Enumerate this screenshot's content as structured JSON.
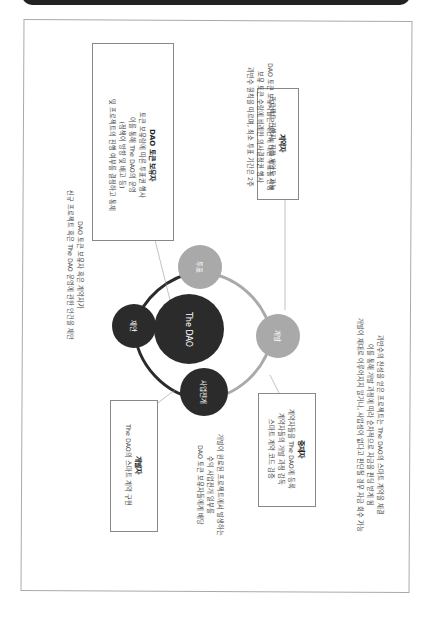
{
  "diagram": {
    "center": {
      "label": "The DAO",
      "color": "#2b2b2b"
    },
    "nodes": [
      {
        "id": "vote",
        "label": "투표",
        "color": "#a9a9a9"
      },
      {
        "id": "develop",
        "label": "개발",
        "color": "#a9a9a9"
      },
      {
        "id": "business",
        "label": "사업전개",
        "color": "#2b2b2b"
      },
      {
        "id": "propose",
        "label": "제안",
        "color": "#2b2b2b"
      }
    ],
    "boxes": {
      "token_holder": {
        "title": "DAO 토큰 보유자",
        "lines": [
          "토큰 보유량에 따른 투표권 행사",
          "이를 통해 The DAO의 운영",
          "(정책이 방향 및 배고 등)",
          "및 프로젝트의 진행 여부를 결정하고 통제"
        ]
      },
      "contractor": {
        "title": "계약자",
        "lines": [
          "프로젝트 진행자, 직접 제안도 가능"
        ]
      },
      "curator": {
        "title": "중재자",
        "lines": [
          "계약자들을 The DAO에 등록",
          "계약자들의 개발 과정 감독",
          "스마트 계약 코드 검증"
        ]
      },
      "developer": {
        "title": "개발자",
        "lines": [
          "The DAO의 스마트 계약 구현"
        ]
      }
    },
    "annotations": {
      "vote": [
        "DAO 토큰 보유자들은 제안에 대한 투표를 진행",
        "보유 토큰 수량에 비례한 의사결정권 행사",
        "과반수 원칙을 따르며, 최소 투표 기간은 2주"
      ],
      "propose": [
        "DAO 토큰 보유자 혹은 계약자가",
        "신규 프로젝트 혹은 The DAO 운영에 관한 안건을 제안"
      ],
      "develop": [
        "과반수의 찬성을 얻은 프로젝트는 The DAO의 스마트 계약을 체결",
        "이를 통해 개발 과정에 따라 순차적으로 자금을 펀딩 받게 됨",
        "개발이 제대로 이루어지지 않거나, 사업성이 없다고 판단될 경우 자금 회수 가능"
      ],
      "business": [
        "개발이 완료된 프로젝트에서 발생하는",
        "수익 사업전개 일부를",
        "DAO 토큰 보유자들에게 배당"
      ]
    }
  }
}
